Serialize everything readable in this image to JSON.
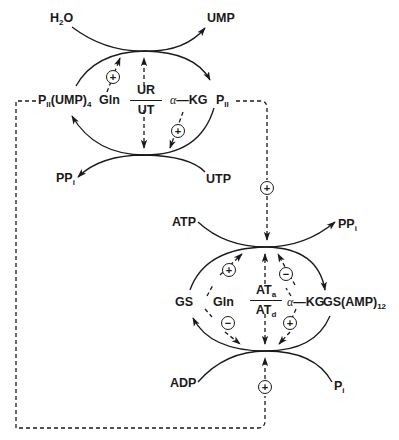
{
  "diagram": {
    "colors": {
      "ink": "#1a1a1a",
      "background": "#ffffff"
    },
    "top_cycle": {
      "substrate_in_top": {
        "main": "H",
        "sub": "2",
        "tail": "O"
      },
      "product_out_top": "UMP",
      "left_form": {
        "main": "P",
        "sub1": "II",
        "mid": "(UMP)",
        "sub2": "4"
      },
      "right_form": {
        "main": "P",
        "sub1": "II"
      },
      "substrate_in_bottom": "UTP",
      "product_out_bottom": {
        "main": "PP",
        "sub": "i"
      },
      "effector_left": "Gln",
      "effector_right": {
        "alpha": "α",
        "dash": "—",
        "name": "KG"
      },
      "enzyme_fraction": {
        "numerator": "UR",
        "denominator": "UT"
      },
      "effects": {
        "gln_on_UR": "+",
        "akg_on_UT": "+"
      }
    },
    "link_signal": "+",
    "bottom_cycle": {
      "substrate_in_top": "ATP",
      "product_out_top": {
        "main": "PP",
        "sub": "i"
      },
      "left_form": "GS",
      "right_form": {
        "main": "GS(AMP)",
        "sub": "12"
      },
      "substrate_in_bottom": "ADP",
      "product_out_bottom": {
        "main": "P",
        "sub": "i"
      },
      "effector_left": "Gln",
      "effector_right": {
        "alpha": "α",
        "dash": "—",
        "name": "KG"
      },
      "enzyme_fraction": {
        "numerator_main": "AT",
        "numerator_sub": "a",
        "denominator_main": "AT",
        "denominator_sub": "d"
      },
      "effects": {
        "gln_on_ATa": "+",
        "akg_on_ATa": "−",
        "gln_on_ATd": "−",
        "akg_on_ATd": "+"
      }
    },
    "feedback_signal": "+"
  }
}
